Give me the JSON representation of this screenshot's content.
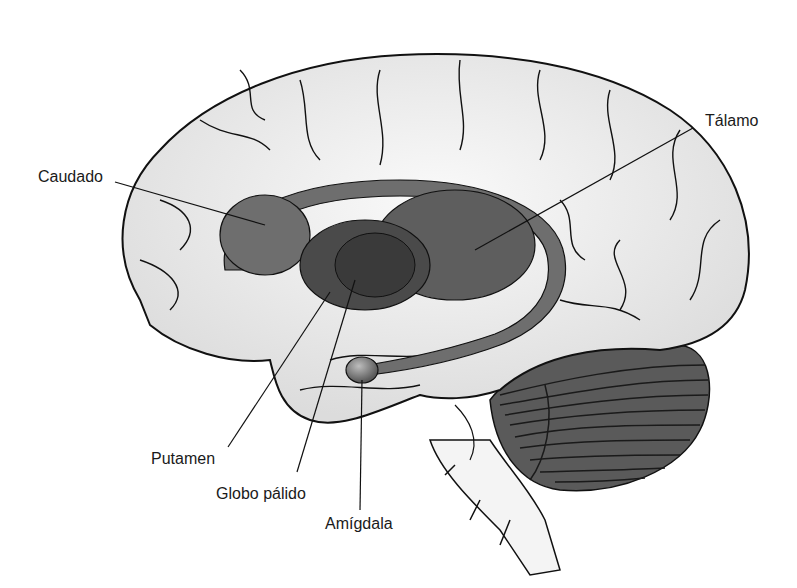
{
  "figure": {
    "colors": {
      "background": "#ffffff",
      "cortex_fill": "#f2f2f2",
      "cortex_shade": "#d9d9d9",
      "outline": "#111111",
      "caudate": "#6e6e6e",
      "thalamus": "#5e5e5e",
      "putamen": "#4a4a4a",
      "globus_pallidus": "#3a3a3a",
      "cerebellum": "#5a5a5a",
      "label_text": "#1a1a1a"
    }
  },
  "labels": {
    "caudado": "Caudado",
    "talamo": "Tálamo",
    "putamen": "Putamen",
    "globo_palido": "Globo pálido",
    "amigdala": "Amígdala"
  }
}
